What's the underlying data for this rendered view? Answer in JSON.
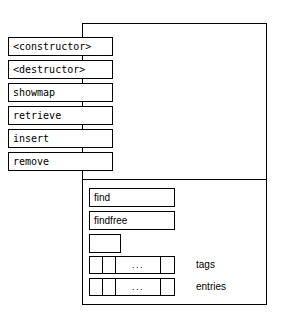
{
  "diagram": {
    "colors": {
      "stroke": "#000000",
      "background": "#ffffff"
    },
    "public_methods": [
      {
        "label": "<constructor>",
        "top": 37
      },
      {
        "label": "<destructor>",
        "top": 60
      },
      {
        "label": "showmap",
        "top": 83
      },
      {
        "label": "retrieve",
        "top": 106
      },
      {
        "label": "insert",
        "top": 129
      },
      {
        "label": "remove",
        "top": 152
      }
    ],
    "private_members": [
      {
        "label": "find",
        "top": 188
      },
      {
        "label": "findfree",
        "top": 211
      }
    ],
    "empty_slot": {
      "label": ""
    },
    "arrays": [
      {
        "label": "tags",
        "top": 256,
        "ellipsis": "..."
      },
      {
        "label": "entries",
        "top": 278,
        "ellipsis": "..."
      }
    ]
  }
}
